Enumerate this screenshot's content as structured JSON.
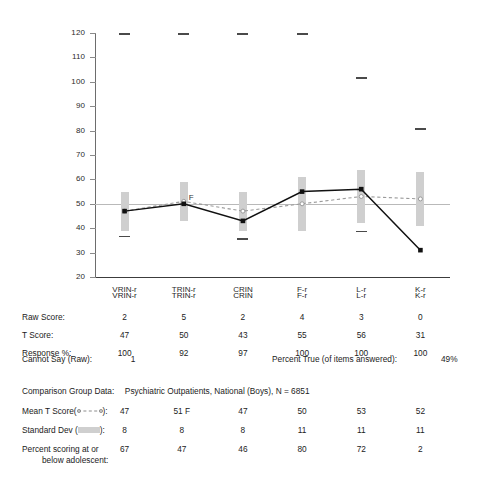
{
  "chart_data": {
    "type": "line",
    "title": "",
    "xlabel": "",
    "ylabel": "",
    "ylim": [
      20,
      120
    ],
    "ytick_step": 10,
    "yticks": [
      120,
      110,
      100,
      90,
      80,
      70,
      60,
      50,
      40,
      30,
      20
    ],
    "categories": [
      "VRIN-r",
      "TRIN-r",
      "CRIN",
      "F-r",
      "L-r",
      "K-r"
    ],
    "grid": false,
    "reference_line": 50,
    "legend_position": "bottom-table",
    "series": [
      {
        "name": "T Score",
        "style": "solid-black-with-square-markers",
        "values": [
          47,
          50,
          43,
          55,
          56,
          31
        ]
      },
      {
        "name": "Mean T Score",
        "style": "dashed-gray-with-open-circle-markers",
        "values": [
          47,
          51,
          47,
          50,
          53,
          52
        ]
      }
    ],
    "error_bars": {
      "name": "Standard Dev",
      "style": "gray-vertical-bar",
      "center": [
        47,
        51,
        47,
        50,
        53,
        52
      ],
      "sd": [
        8,
        8,
        8,
        11,
        11,
        11
      ]
    },
    "upper_markers": {
      "name": "upper-limit-dash",
      "values": [
        120,
        120,
        120,
        120,
        102,
        81
      ]
    },
    "lower_markers": {
      "name": "lower-limit-dash",
      "values": [
        37,
        null,
        36,
        null,
        39,
        null
      ]
    },
    "annotations": [
      {
        "text": "F",
        "category": "TRIN-r",
        "value": 50
      }
    ]
  },
  "chart": {
    "axis_labels": [
      "VRIN-r",
      "TRIN-r",
      "CRIN",
      "F-r",
      "L-r",
      "K-r"
    ],
    "y_ticks": [
      "120",
      "110",
      "100",
      "90",
      "80",
      "70",
      "60",
      "50",
      "40",
      "30",
      "20"
    ],
    "f_annotation": "F",
    "colors": {
      "score_line": "#000000",
      "mean_line": "#8c8c8c",
      "sd_bar": "#cfcfcf",
      "reference_line": "#b9b9b9",
      "axis": "#3c3c3c"
    }
  },
  "table": {
    "column_headers": [
      "VRIN-r",
      "TRIN-r",
      "CRIN",
      "F-r",
      "L-r",
      "K-r"
    ],
    "rows": [
      {
        "label": "Raw Score:",
        "values": [
          "2",
          "5",
          "2",
          "4",
          "3",
          "0"
        ]
      },
      {
        "label": "T Score:",
        "values": [
          "47",
          "50",
          "43",
          "55",
          "56",
          "31"
        ]
      },
      {
        "label": "Response %:",
        "values": [
          "100",
          "92",
          "97",
          "100",
          "100",
          "100"
        ]
      }
    ],
    "cannot_say_label": "Cannot Say (Raw):",
    "cannot_say_value": "1",
    "percent_true_label": "Percent True (of items answered):",
    "percent_true_value": "49%"
  },
  "comparison": {
    "heading_label": "Comparison Group Data:",
    "heading_value": "Psychiatric Outpatients, National (Boys), N = 6851",
    "mean_label_pre": "Mean T Score(",
    "mean_label_post": "):",
    "mean_values": [
      "47",
      "51 F",
      "47",
      "50",
      "53",
      "52"
    ],
    "sd_label_pre": "Standard Dev (",
    "sd_label_post": "):",
    "sd_values": [
      "8",
      "8",
      "8",
      "11",
      "11",
      "11"
    ],
    "percent_label_line1": "Percent scoring at or",
    "percent_label_line2": "below adolescent:",
    "percent_values": [
      "67",
      "47",
      "46",
      "80",
      "72",
      "2"
    ]
  }
}
